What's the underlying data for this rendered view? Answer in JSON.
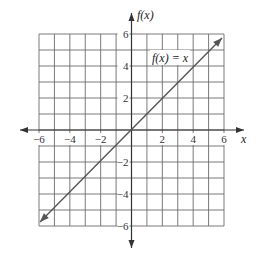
{
  "chart_data": {
    "type": "line",
    "title": "",
    "xlabel": "x",
    "ylabel": "f(x)",
    "xlim": [
      -6,
      6
    ],
    "ylim": [
      -6,
      6
    ],
    "grid": true,
    "grid_step": 1,
    "x_ticks": [
      -6,
      -4,
      -2,
      2,
      4,
      6
    ],
    "y_ticks": [
      -6,
      -4,
      -2,
      2,
      4,
      6
    ],
    "x_tick_labels": [
      "−6",
      "−4",
      "−2",
      "2",
      "4",
      "6"
    ],
    "y_tick_labels": [
      "−6",
      "−4",
      "−2",
      "2",
      "4",
      "6"
    ],
    "series": [
      {
        "name": "f(x) = x",
        "x": [
          -6,
          -4,
          -2,
          0,
          2,
          4,
          6
        ],
        "y": [
          -6,
          -4,
          -2,
          0,
          2,
          4,
          6
        ],
        "arrows": "both",
        "color": "#555555"
      }
    ],
    "annotations": [
      {
        "text": "f(x) = x",
        "x": 3,
        "y": 4.5
      }
    ],
    "legend": "none"
  },
  "colors": {
    "grid": "#6b6b6b",
    "axis": "#333333",
    "line": "#555555",
    "background": "#ffffff"
  }
}
